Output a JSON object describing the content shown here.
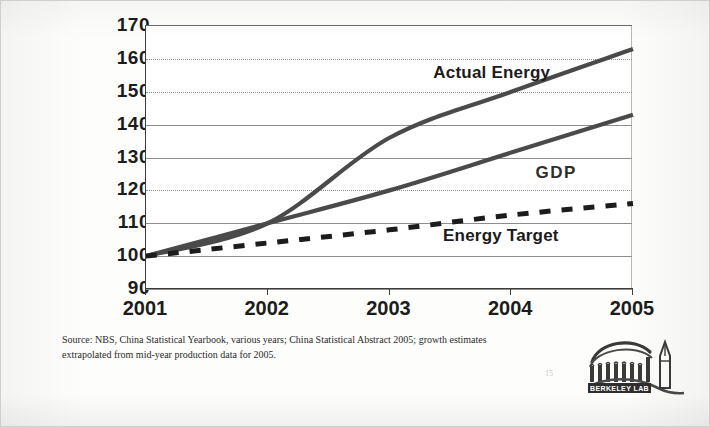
{
  "chart_data": {
    "type": "line",
    "title": "",
    "subtitle": "",
    "xlabel": "",
    "ylabel": "",
    "x": [
      2001,
      2002,
      2003,
      2004,
      2005
    ],
    "xtick_labels": [
      "2001",
      "2002",
      "2003",
      "2004",
      "2005"
    ],
    "ytick_labels": [
      "170",
      "160",
      "150",
      "140",
      "130",
      "120",
      "110",
      "100",
      "90"
    ],
    "ytick_values": [
      170,
      160,
      150,
      140,
      130,
      120,
      110,
      100,
      90
    ],
    "ylim": [
      90,
      170
    ],
    "xlim": [
      2001,
      2005
    ],
    "grid": true,
    "gridline_styles": [
      "solid",
      "dotted",
      "dotted",
      "solid",
      "solid",
      "dotted",
      "solid",
      "solid",
      "solid"
    ],
    "legend_position": "inline-annotations",
    "index_base": "2001 = 100",
    "series": [
      {
        "name": "Actual Energy",
        "style": "solid",
        "color": "#4a4a4a",
        "values": [
          100,
          110,
          136,
          150,
          163
        ],
        "label_x_pct": 59,
        "label_y_pct": 14
      },
      {
        "name": "GDP",
        "style": "solid",
        "color": "#4a4a4a",
        "values": [
          100,
          110,
          120,
          131.5,
          143
        ],
        "label_x_pct": 80,
        "label_y_pct": 52
      },
      {
        "name": "Energy Target",
        "style": "dashed",
        "color": "#1c1c1c",
        "values": [
          100,
          104,
          108,
          112.5,
          116
        ],
        "label_x_pct": 61,
        "label_y_pct": 76
      }
    ]
  },
  "footnote": {
    "text": "Source:  NBS, China Statistical Yearbook, various years; China Statistical Abstract 2005; growth estimates extrapolated from mid-year production data for 2005."
  },
  "page_number": "15",
  "logo": {
    "wordmark": "BERKELEY LAB",
    "alt": "Berkeley Lab logo"
  }
}
